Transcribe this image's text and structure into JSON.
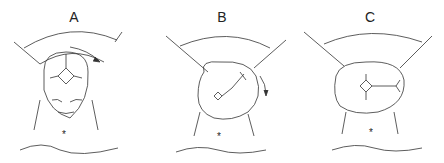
{
  "diagram": {
    "panels": [
      {
        "label": "A",
        "description": "Occiput anterior head view with sagittal suture, rotation arrow clockwise"
      },
      {
        "label": "B",
        "description": "Head rotated obliquely, arrow downward"
      },
      {
        "label": "C",
        "description": "Head fully rotated transverse, sutures horizontal"
      }
    ],
    "markers": {
      "asterisk": "*"
    }
  }
}
